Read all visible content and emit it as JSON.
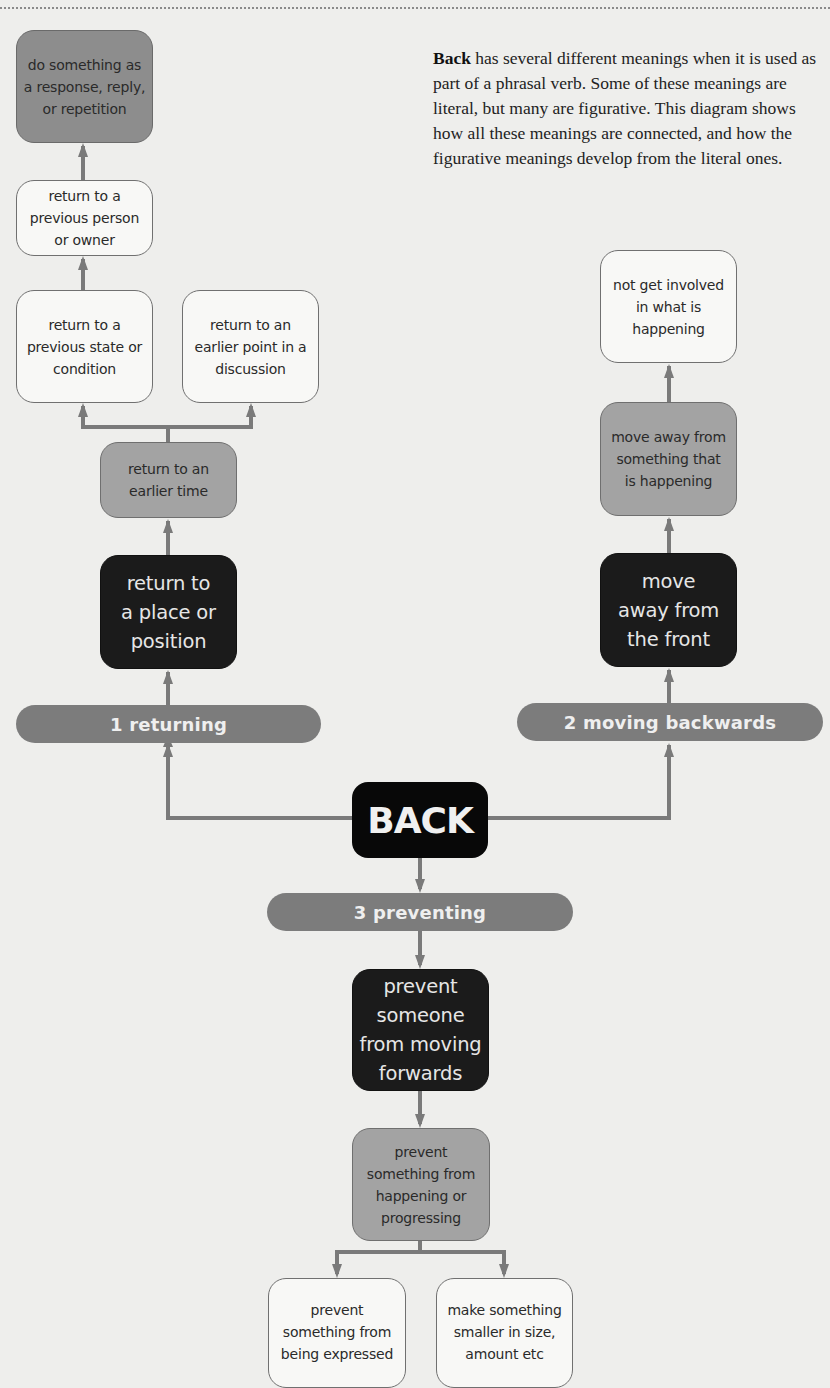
{
  "intro": {
    "headword": "Back",
    "text": " has several different meanings when it is used as part of a phrasal verb. Some of these meanings are literal, but many are figurative. This diagram shows how all these meanings are connected, and how the figurative meanings develop from the literal ones."
  },
  "center": {
    "label": "BACK"
  },
  "colors": {
    "background": "#eeeeec",
    "node_white": "#f8f8f6",
    "node_mid": "#a3a3a3",
    "node_dark": "#8d8d8d",
    "node_black": "#1b1b1b",
    "pill": "#7c7c7c",
    "connector": "#7a7a7a"
  },
  "branches": {
    "returning": {
      "label": "1 returning",
      "nodes": {
        "place_position": "return to\na place or\nposition",
        "earlier_time": "return to an\nearlier time",
        "previous_state": "return to a\nprevious state or\ncondition",
        "earlier_point": "return to an\nearlier point in a\ndiscussion",
        "previous_person": "return to a\nprevious person\nor owner",
        "response": "do something as\na response, reply,\nor repetition"
      }
    },
    "moving_backwards": {
      "label": "2 moving backwards",
      "nodes": {
        "away_front": "move\naway from\nthe front",
        "away_happening": "move away from\nsomething that\nis happening",
        "not_involved": "not get involved\nin what is\nhappening"
      }
    },
    "preventing": {
      "label": "3 preventing",
      "nodes": {
        "prevent_moving": "prevent\nsomeone\nfrom moving\nforwards",
        "prevent_happening": "prevent\nsomething from\nhappening or\nprogressing",
        "prevent_expressed": "prevent\nsomething from\nbeing expressed",
        "make_smaller": "make something\nsmaller in size,\namount etc"
      }
    }
  }
}
